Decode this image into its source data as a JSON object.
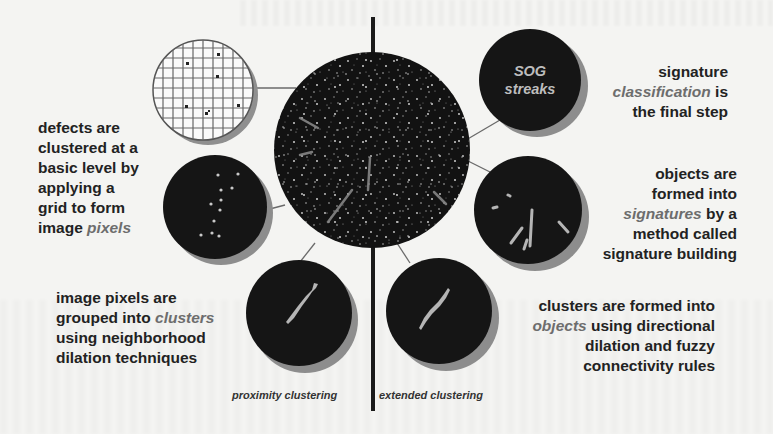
{
  "diagram": {
    "captions": {
      "grid_pixels": {
        "lines": [
          "defects are",
          "clustered at a",
          "basic level by",
          "applying a",
          "grid to form"
        ],
        "last_plain": "image ",
        "last_emph": "pixels"
      },
      "clusters": {
        "line1": "image pixels are",
        "line2_plain": "grouped into ",
        "line2_emph": "clusters",
        "line3": "using neighborhood",
        "line4": "dilation techniques"
      },
      "objects": {
        "line1": "clusters are formed into",
        "line2_emph": "objects",
        "line2_plain": " using directional",
        "line3": "dilation and fuzzy",
        "line4": "connectivity rules"
      },
      "signatures": {
        "line1": "objects are",
        "line2": "formed into",
        "line3_emph": "signatures",
        "line3_plain": " by a",
        "line4": "method called",
        "line5": "signature building"
      },
      "classification": {
        "line1": "signature",
        "line2_emph": "classification",
        "line2_plain": " is",
        "line3": "the final step"
      }
    },
    "stage_labels": {
      "left": "proximity clustering",
      "right": "extended clustering"
    },
    "sog_circle": {
      "line1": "SOG",
      "line2": "streaks"
    },
    "nodes": [
      {
        "id": "wafer-map",
        "label": "full wafer defect map"
      },
      {
        "id": "grid",
        "label": "grid overlay"
      },
      {
        "id": "pixels",
        "label": "image pixels"
      },
      {
        "id": "clusters",
        "label": "clusters"
      },
      {
        "id": "objects",
        "label": "objects"
      },
      {
        "id": "signatures",
        "label": "signatures"
      },
      {
        "id": "classification",
        "label": "SOG streaks"
      }
    ],
    "colors": {
      "circle_fill": "#161616",
      "circle_shadow": "#8a8a8a",
      "emph_text": "#6d6d6d",
      "body_text": "#222222",
      "grid_line": "#555555",
      "feature": "#b8b8b8"
    }
  }
}
